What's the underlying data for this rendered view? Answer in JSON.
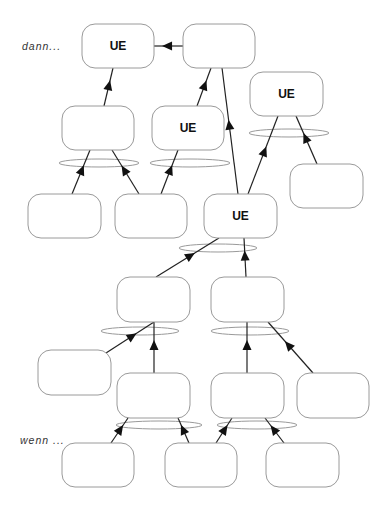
{
  "labels": {
    "top": "dann...",
    "bottom": "wenn ..."
  },
  "node_text": "UE",
  "nodes": [
    {
      "id": "n1",
      "x": 82,
      "y": 24,
      "w": 72,
      "h": 44,
      "label": "UE"
    },
    {
      "id": "n2",
      "x": 183,
      "y": 24,
      "w": 72,
      "h": 44,
      "label": ""
    },
    {
      "id": "n3",
      "x": 62,
      "y": 106,
      "w": 72,
      "h": 44,
      "label": ""
    },
    {
      "id": "n4",
      "x": 152,
      "y": 106,
      "w": 72,
      "h": 44,
      "label": "UE"
    },
    {
      "id": "n5",
      "x": 250,
      "y": 72,
      "w": 73,
      "h": 44,
      "label": "UE"
    },
    {
      "id": "n6",
      "x": 28,
      "y": 194,
      "w": 73,
      "h": 44,
      "label": ""
    },
    {
      "id": "n7",
      "x": 115,
      "y": 194,
      "w": 72,
      "h": 44,
      "label": ""
    },
    {
      "id": "n8",
      "x": 204,
      "y": 194,
      "w": 73,
      "h": 44,
      "label": "UE"
    },
    {
      "id": "n9",
      "x": 290,
      "y": 164,
      "w": 73,
      "h": 44,
      "label": ""
    },
    {
      "id": "n10",
      "x": 117,
      "y": 277,
      "w": 73,
      "h": 45,
      "label": ""
    },
    {
      "id": "n11",
      "x": 211,
      "y": 277,
      "w": 73,
      "h": 45,
      "label": ""
    },
    {
      "id": "n12",
      "x": 38,
      "y": 350,
      "w": 73,
      "h": 45,
      "label": ""
    },
    {
      "id": "n13",
      "x": 117,
      "y": 373,
      "w": 73,
      "h": 45,
      "label": ""
    },
    {
      "id": "n14",
      "x": 211,
      "y": 373,
      "w": 73,
      "h": 45,
      "label": ""
    },
    {
      "id": "n15",
      "x": 297,
      "y": 373,
      "w": 72,
      "h": 45,
      "label": ""
    },
    {
      "id": "n16",
      "x": 62,
      "y": 443,
      "w": 72,
      "h": 44,
      "label": ""
    },
    {
      "id": "n17",
      "x": 165,
      "y": 443,
      "w": 72,
      "h": 44,
      "label": ""
    },
    {
      "id": "n18",
      "x": 266,
      "y": 443,
      "w": 73,
      "h": 44,
      "label": ""
    }
  ],
  "ellipses": [
    {
      "cx": 99,
      "cy": 163,
      "rx": 40,
      "ry": 4
    },
    {
      "cx": 190,
      "cy": 163,
      "rx": 40,
      "ry": 4
    },
    {
      "cx": 289,
      "cy": 133,
      "rx": 40,
      "ry": 4
    },
    {
      "cx": 218,
      "cy": 248,
      "rx": 39,
      "ry": 4
    },
    {
      "cx": 140,
      "cy": 331,
      "rx": 39,
      "ry": 4
    },
    {
      "cx": 250,
      "cy": 331,
      "rx": 39,
      "ry": 4
    },
    {
      "cx": 159,
      "cy": 425,
      "rx": 43,
      "ry": 4
    },
    {
      "cx": 257,
      "cy": 425,
      "rx": 40,
      "ry": 4
    }
  ],
  "edges": [
    {
      "from": "n2",
      "to": "n1",
      "x1": 183,
      "y1": 46,
      "x2": 154,
      "y2": 46
    },
    {
      "from": "n3",
      "to": "n1",
      "x1": 104,
      "y1": 106,
      "x2": 113,
      "y2": 68
    },
    {
      "from": "n4",
      "to": "n2",
      "x1": 197,
      "y1": 106,
      "x2": 211,
      "y2": 68
    },
    {
      "from": "n8",
      "to": "n2",
      "x1": 238,
      "y1": 194,
      "x2": 222,
      "y2": 68
    },
    {
      "from": "n6",
      "to": "n3",
      "x1": 72,
      "y1": 194,
      "x2": 90,
      "y2": 150
    },
    {
      "from": "n7",
      "to": "n3",
      "x1": 139,
      "y1": 194,
      "x2": 112,
      "y2": 150
    },
    {
      "from": "n7",
      "to": "n4",
      "x1": 161,
      "y1": 194,
      "x2": 178,
      "y2": 150
    },
    {
      "from": "n8",
      "to": "n5",
      "x1": 248,
      "y1": 194,
      "x2": 278,
      "y2": 116
    },
    {
      "from": "n9",
      "to": "n5",
      "x1": 317,
      "y1": 164,
      "x2": 296,
      "y2": 116
    },
    {
      "from": "n10",
      "to": "n8",
      "x1": 156,
      "y1": 277,
      "x2": 219,
      "y2": 238
    },
    {
      "from": "n11",
      "to": "n8",
      "x1": 246,
      "y1": 277,
      "x2": 244,
      "y2": 238
    },
    {
      "from": "n12",
      "to": "n10",
      "x1": 106,
      "y1": 353,
      "x2": 154,
      "y2": 322
    },
    {
      "from": "n13",
      "to": "n10",
      "x1": 154,
      "y1": 373,
      "x2": 154,
      "y2": 322
    },
    {
      "from": "n14",
      "to": "n11",
      "x1": 247,
      "y1": 373,
      "x2": 247,
      "y2": 322
    },
    {
      "from": "n15",
      "to": "n11",
      "x1": 313,
      "y1": 373,
      "x2": 268,
      "y2": 322
    },
    {
      "from": "n16",
      "to": "n13",
      "x1": 111,
      "y1": 443,
      "x2": 128,
      "y2": 418
    },
    {
      "from": "n17",
      "to": "n13",
      "x1": 189,
      "y1": 443,
      "x2": 178,
      "y2": 418
    },
    {
      "from": "n17",
      "to": "n14",
      "x1": 216,
      "y1": 443,
      "x2": 232,
      "y2": 418
    },
    {
      "from": "n18",
      "to": "n14",
      "x1": 284,
      "y1": 443,
      "x2": 265,
      "y2": 418
    }
  ],
  "colors": {
    "box_stroke": "#9a9a9a",
    "edge": "#222222",
    "text": "#111111"
  }
}
